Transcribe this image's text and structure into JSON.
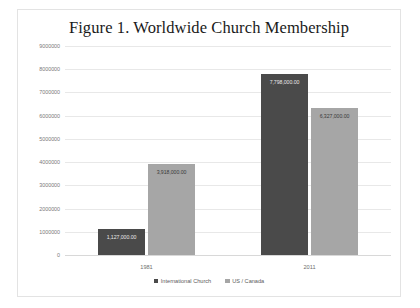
{
  "chart_data": {
    "type": "bar",
    "title": "Figure 1. Worldwide Church Membership",
    "xlabel": "",
    "ylabel": "",
    "categories": [
      "1981",
      "2011"
    ],
    "series": [
      {
        "name": "International Church",
        "color": "#4a4a4a",
        "values": [
          1127000,
          7798000
        ],
        "labels": [
          "1,127,000.00",
          "7,798,000.00"
        ]
      },
      {
        "name": "US / Canada",
        "color": "#a6a6a6",
        "values": [
          3918000,
          6327000
        ],
        "labels": [
          "3,918,000.00",
          "6,327,000.00"
        ]
      }
    ],
    "ylim": [
      0,
      9000000
    ],
    "ytick_values": [
      0,
      1000000,
      2000000,
      3000000,
      4000000,
      5000000,
      6000000,
      7000000,
      8000000,
      9000000
    ],
    "ytick_labels": [
      "0",
      "1000000",
      "2000000",
      "3000000",
      "4000000",
      "5000000",
      "6000000",
      "7000000",
      "8000000",
      "9000000"
    ],
    "grid": true,
    "legend_position": "bottom"
  },
  "legend": {
    "items": [
      {
        "label": "International Church",
        "color": "#4a4a4a"
      },
      {
        "label": "US / Canada",
        "color": "#a6a6a6"
      }
    ]
  },
  "colors": {
    "series_dark": "#4a4a4a",
    "series_light": "#a6a6a6",
    "gridline": "#e8e8e8",
    "border": "#e3e3e3",
    "background": "#ffffff"
  }
}
